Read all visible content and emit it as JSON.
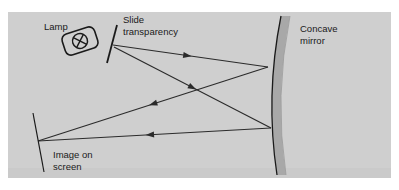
{
  "figure": {
    "panel": {
      "background_color": "#cfcfcf",
      "x": 8,
      "y": 12,
      "width": 383,
      "height": 166
    },
    "page_background_color": "#ffffff",
    "ray_color": "#2b2b2b",
    "outline_color": "#1a1a1a",
    "mirror_body_color": "#a8a8a8"
  },
  "labels": {
    "lamp": "Lamp",
    "slide_line1": "Slide",
    "slide_line2": "transparency",
    "mirror_line1": "Concave",
    "mirror_line2": "mirror",
    "screen_line1": "Image on",
    "screen_line2": "screen"
  },
  "components": {
    "lamp": {
      "name": "lamp-housing",
      "center_x": 80,
      "center_y": 41,
      "rotation_deg": -18,
      "housing_width": 34,
      "housing_height": 22,
      "bulb_radius": 7.5,
      "bulb_symbol": "cross-filament"
    },
    "slide": {
      "name": "slide-transparency",
      "top_x": 117,
      "top_y": 25,
      "bottom_x": 107,
      "bottom_y": 63,
      "pivot_x": 112,
      "pivot_y": 44
    },
    "mirror": {
      "name": "concave-mirror",
      "top_x": 281,
      "top_y": 16,
      "bottom_x": 277,
      "bottom_y": 175,
      "bulge_x": 265,
      "thickness": 9,
      "reflect_point_upper_x": 268,
      "reflect_point_upper_y": 67,
      "reflect_point_lower_x": 271,
      "reflect_point_lower_y": 128
    },
    "screen": {
      "name": "image-screen",
      "top_x": 33,
      "top_y": 113,
      "bottom_x": 44,
      "bottom_y": 172,
      "image_point_x": 38,
      "image_point_y": 141
    }
  },
  "rays": [
    {
      "name": "ray-slide-to-mirror-upper",
      "from": "slide",
      "to": "mirror-upper",
      "x1": 113,
      "y1": 45,
      "x2": 268,
      "y2": 67,
      "arrow_t": 0.48,
      "direction": "rightward"
    },
    {
      "name": "ray-slide-to-mirror-lower",
      "from": "slide",
      "to": "mirror-lower",
      "x1": 114,
      "y1": 47,
      "x2": 271,
      "y2": 128,
      "arrow_t": 0.5,
      "direction": "rightward-down"
    },
    {
      "name": "ray-mirror-upper-to-screen",
      "from": "mirror-upper",
      "to": "screen",
      "x1": 268,
      "y1": 67,
      "x2": 38,
      "y2": 141,
      "arrow_t": 0.5,
      "direction": "leftward-down"
    },
    {
      "name": "ray-mirror-lower-to-screen",
      "from": "mirror-lower",
      "to": "screen",
      "x1": 271,
      "y1": 128,
      "x2": 38,
      "y2": 141,
      "arrow_t": 0.52,
      "direction": "leftward"
    }
  ],
  "label_positions": {
    "lamp": {
      "x": 44,
      "y": 30
    },
    "slide": {
      "x": 123,
      "y": 23
    },
    "mirror": {
      "x": 300,
      "y": 32
    },
    "screen": {
      "x": 53,
      "y": 158
    }
  }
}
